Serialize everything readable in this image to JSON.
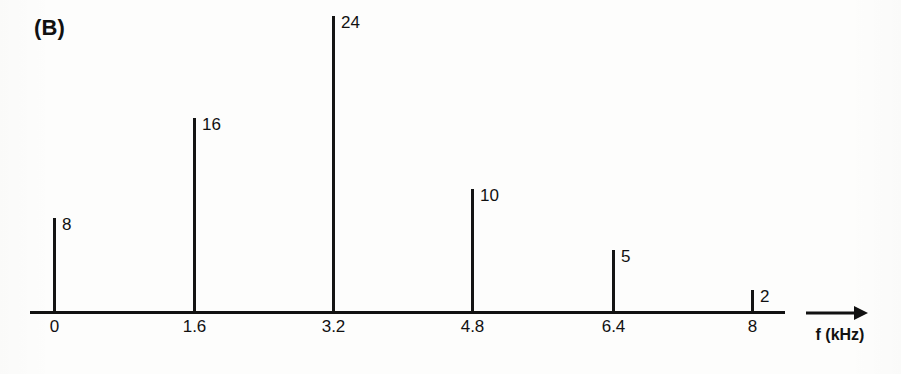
{
  "figure": {
    "panel_label": "(B)",
    "background_color": "#fdfdfc",
    "ink_color": "#111111"
  },
  "axis": {
    "arrow_icon": "right-arrow-icon",
    "label": "f (kHz)"
  },
  "chart_data": {
    "type": "bar",
    "title": "(B)",
    "subtitle": "",
    "xlabel": "f (kHz)",
    "ylabel": "",
    "categories": [
      "0",
      "1.6",
      "3.2",
      "4.8",
      "6.4",
      "8"
    ],
    "x": [
      0,
      1.6,
      3.2,
      4.8,
      6.4,
      8
    ],
    "values": [
      8,
      16,
      24,
      10,
      5,
      2
    ],
    "data_labels": [
      "8",
      "16",
      "24",
      "10",
      "5",
      "2"
    ],
    "xlim": [
      0,
      8.6
    ],
    "ylim": [
      0,
      24
    ],
    "xtick_labels": [
      "0",
      "1.6",
      "3.2",
      "4.8",
      "6.4",
      "8"
    ],
    "ytick_labels": [],
    "grid": false,
    "legend": null,
    "legend_position": "none",
    "annotations": [
      "(B)"
    ]
  },
  "lines": [
    {
      "name": "line-0",
      "freq_label": "0",
      "value_label": "8",
      "value": 8,
      "x_px": 53,
      "height_px": 95
    },
    {
      "name": "line-1",
      "freq_label": "1.6",
      "value_label": "16",
      "value": 16,
      "x_px": 193,
      "height_px": 195
    },
    {
      "name": "line-2",
      "freq_label": "3.2",
      "value_label": "24",
      "value": 24,
      "x_px": 332,
      "height_px": 297
    },
    {
      "name": "line-3",
      "freq_label": "4.8",
      "value_label": "10",
      "value": 10,
      "x_px": 471,
      "height_px": 124
    },
    {
      "name": "line-4",
      "freq_label": "6.4",
      "value_label": "5",
      "value": 5,
      "x_px": 612,
      "height_px": 63
    },
    {
      "name": "line-5",
      "freq_label": "8",
      "value_label": "2",
      "value": 2,
      "x_px": 751,
      "height_px": 23
    }
  ]
}
